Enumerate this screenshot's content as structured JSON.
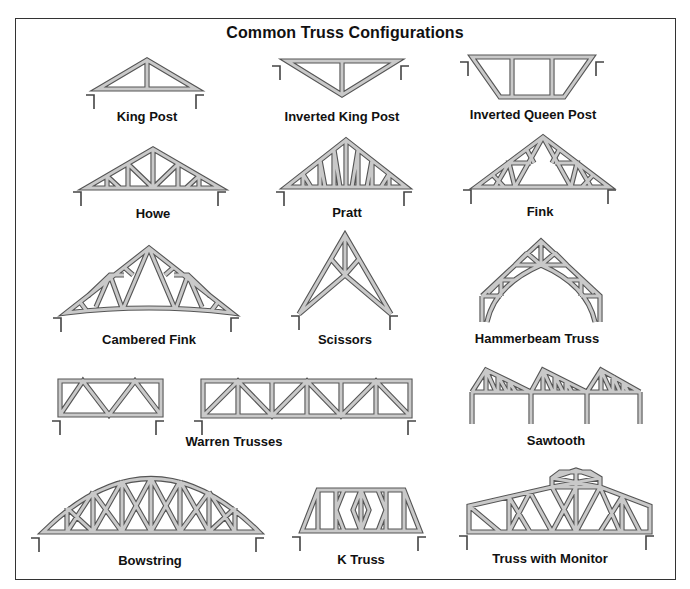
{
  "title": "Common Truss Configurations",
  "trusses": [
    {
      "id": "king-post",
      "label": "King Post"
    },
    {
      "id": "inverted-king-post",
      "label": "Inverted King Post"
    },
    {
      "id": "inverted-queen-post",
      "label": "Inverted Queen Post"
    },
    {
      "id": "howe",
      "label": "Howe"
    },
    {
      "id": "pratt",
      "label": "Pratt"
    },
    {
      "id": "fink",
      "label": "Fink"
    },
    {
      "id": "cambered-fink",
      "label": "Cambered Fink"
    },
    {
      "id": "scissors",
      "label": "Scissors"
    },
    {
      "id": "hammerbeam",
      "label": "Hammerbeam Truss"
    },
    {
      "id": "warren",
      "label": "Warren Trusses"
    },
    {
      "id": "sawtooth",
      "label": "Sawtooth"
    },
    {
      "id": "bowstring",
      "label": "Bowstring"
    },
    {
      "id": "k-truss",
      "label": "K Truss"
    },
    {
      "id": "truss-with-monitor",
      "label": "Truss with Monitor"
    }
  ],
  "colors": {
    "member_fill": "#c9c9c9",
    "member_outline": "#555555",
    "frame_border": "#333333",
    "text": "#111111"
  }
}
